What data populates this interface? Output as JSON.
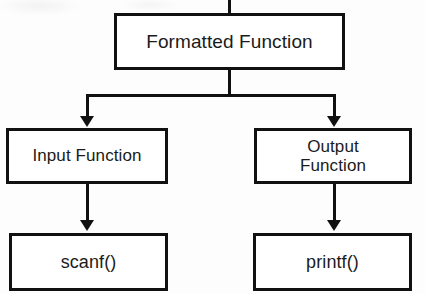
{
  "diagram": {
    "type": "flowchart-tree",
    "stroke_color": "#111111",
    "text_color": "#1b1b1b",
    "background_color": "#ffffff",
    "nodes": [
      {
        "id": "formatted-function",
        "label": "Formatted Function",
        "level": "root",
        "x": 114,
        "y": 13,
        "w": 231,
        "h": 57,
        "font_size": 19
      },
      {
        "id": "input-function",
        "label": "Input Function",
        "level": "branch",
        "x": 6,
        "y": 128,
        "w": 162,
        "h": 56,
        "font_size": 17
      },
      {
        "id": "output-function",
        "label": "Output\nFunction",
        "level": "branch",
        "x": 254,
        "y": 128,
        "w": 158,
        "h": 56,
        "font_size": 17
      },
      {
        "id": "scanf",
        "label": "scanf()",
        "level": "leaf",
        "x": 9,
        "y": 233,
        "w": 159,
        "h": 58,
        "font_size": 18
      },
      {
        "id": "printf",
        "label": "printf()",
        "level": "leaf",
        "x": 253,
        "y": 233,
        "w": 159,
        "h": 58,
        "font_size": 18
      }
    ],
    "edges": [
      {
        "id": "stub-top",
        "from": "",
        "to": "formatted-function",
        "kind": "stub"
      },
      {
        "id": "root-to-input",
        "from": "formatted-function",
        "to": "input-function",
        "kind": "elbow-arrow"
      },
      {
        "id": "root-to-output",
        "from": "formatted-function",
        "to": "output-function",
        "kind": "elbow-arrow"
      },
      {
        "id": "input-to-scanf",
        "from": "input-function",
        "to": "scanf",
        "kind": "straight-arrow"
      },
      {
        "id": "output-to-printf",
        "from": "output-function",
        "to": "printf",
        "kind": "straight-arrow"
      }
    ]
  }
}
